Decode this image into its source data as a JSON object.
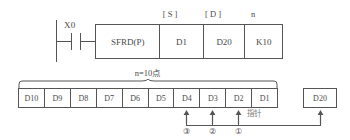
{
  "diagram": {
    "line_color": "#555555",
    "text_color": "#4a4a4a",
    "background": "#ffffff"
  },
  "rung": {
    "contact_label": "X0",
    "contact_type": "normally-open"
  },
  "instruction": {
    "operand_tags": {
      "source": "[ S ]",
      "destination": "[ D ]",
      "count": "n"
    },
    "cells": [
      {
        "name": "opcode",
        "value": "SFRD(P)"
      },
      {
        "name": "source",
        "value": "D1"
      },
      {
        "name": "destination",
        "value": "D20"
      },
      {
        "name": "count",
        "value": "K10"
      }
    ]
  },
  "span": {
    "label": "n=10点"
  },
  "registers": [
    {
      "value": "D10"
    },
    {
      "value": "D9"
    },
    {
      "value": "D8"
    },
    {
      "value": "D7"
    },
    {
      "value": "D6"
    },
    {
      "value": "D5"
    },
    {
      "value": "D4"
    },
    {
      "value": "D3"
    },
    {
      "value": "D2"
    },
    {
      "value": "D1"
    }
  ],
  "pointer_note": "指针",
  "destination_box": {
    "value": "D20"
  },
  "step_markers": [
    {
      "label": "③",
      "source_register": "D4"
    },
    {
      "label": "②",
      "source_register": "D3"
    },
    {
      "label": "①",
      "source_register": "D2"
    }
  ]
}
